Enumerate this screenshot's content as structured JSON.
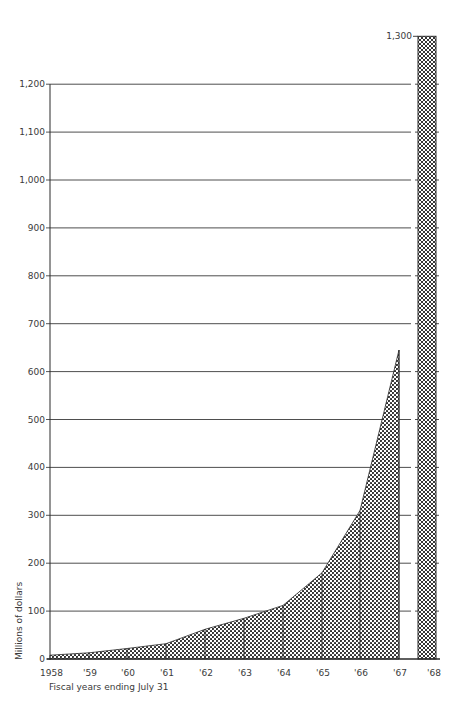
{
  "chart_data": {
    "type": "area",
    "title": "",
    "xlabel": "Fiscal years ending July 31",
    "ylabel": "Millions of dollars",
    "ylim": [
      0,
      1300
    ],
    "yticks": [
      0,
      100,
      200,
      300,
      400,
      500,
      600,
      700,
      800,
      900,
      1000,
      1100,
      1200,
      1300
    ],
    "ytick_labels": [
      "0",
      "100",
      "200",
      "300",
      "400",
      "500",
      "600",
      "700",
      "800",
      "900",
      "1,000",
      "1,100",
      "1,200",
      "1,300"
    ],
    "categories": [
      "1958",
      "'59",
      "'60",
      "'61",
      "'62",
      "'63",
      "'64",
      "'65",
      "'66",
      "'67",
      "'68"
    ],
    "series": [
      {
        "name": "Actual (stippled area)",
        "pattern": "stipple",
        "x": [
          "1958",
          "'59",
          "'60",
          "'61",
          "'62",
          "'63",
          "'64",
          "'65",
          "'66",
          "'67"
        ],
        "values": [
          8,
          13,
          22,
          32,
          62,
          85,
          112,
          180,
          310,
          645
        ]
      },
      {
        "name": "1968 (cross-hatched bar)",
        "pattern": "crosshatch",
        "x": [
          "'68"
        ],
        "values": [
          1300
        ]
      }
    ],
    "grid": true,
    "legend": "none"
  },
  "colors": {
    "ink": "#2a2a2a",
    "grid": "#3a3a3a",
    "background": "#ffffff"
  }
}
